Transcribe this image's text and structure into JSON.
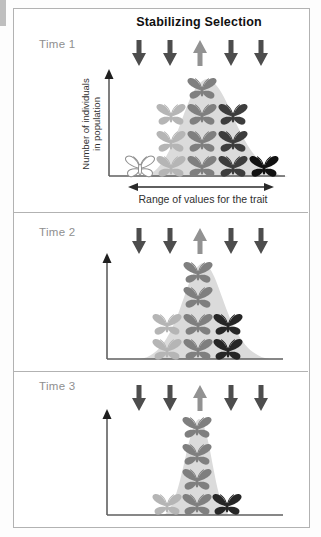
{
  "title": "Stabilizing Selection",
  "x_axis_label": "Range of values for the trait",
  "y_axis_lines": [
    "Number of individuals",
    "in population"
  ],
  "panels": [
    {
      "label": "Time 1",
      "arrows": [
        "down",
        "down",
        "up",
        "down",
        "down"
      ],
      "butterfly_rows": [
        [
          "medium"
        ],
        [
          "light",
          "medium",
          "dark"
        ],
        [
          "light",
          "medium",
          "dark"
        ],
        [
          "white",
          "light",
          "medium",
          "dark",
          "black"
        ]
      ]
    },
    {
      "label": "Time 2",
      "arrows": [
        "down",
        "down",
        "up",
        "down",
        "down"
      ],
      "butterfly_rows": [
        [
          "medium"
        ],
        [
          "medium"
        ],
        [
          "light",
          "medium",
          "vdark"
        ],
        [
          "light",
          "medium",
          "vdark"
        ]
      ]
    },
    {
      "label": "Time 3",
      "arrows": [
        "down",
        "down",
        "up",
        "down",
        "down"
      ],
      "butterfly_rows": [
        [
          "medium"
        ],
        [
          "medium"
        ],
        [
          "medium"
        ],
        [
          "light",
          "medium",
          "vdark"
        ]
      ]
    }
  ],
  "colors": {
    "white": "#ffffff",
    "light": "#b5b5b5",
    "medium": "#7f7f7f",
    "dark": "#3d3d3d",
    "vdark": "#262626",
    "black": "#111111",
    "outline": "#8f8f8f",
    "down_arrow": "#4d4d4d",
    "up_arrow": "#929292",
    "curve": "#dbdbdb",
    "axis": "#5f5f5f",
    "axis_head": "#1f1f1f"
  }
}
